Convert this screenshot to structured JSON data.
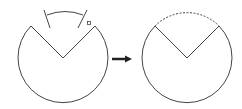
{
  "diagram": {
    "stroke_color": "#444444",
    "left_figure": {
      "center": [
        63,
        58
      ],
      "radius": 45,
      "v_left": [
        31,
        26
      ],
      "v_right": [
        95,
        26
      ],
      "marker": "small-square"
    },
    "arrow": {
      "from": [
        113,
        58
      ],
      "to": [
        131,
        58
      ],
      "direction": "right"
    },
    "right_figure": {
      "center": [
        187,
        58
      ],
      "radius": 45,
      "v_left": [
        155,
        26
      ],
      "v_right": [
        219,
        26
      ],
      "top_arc_style": "dashed"
    }
  }
}
